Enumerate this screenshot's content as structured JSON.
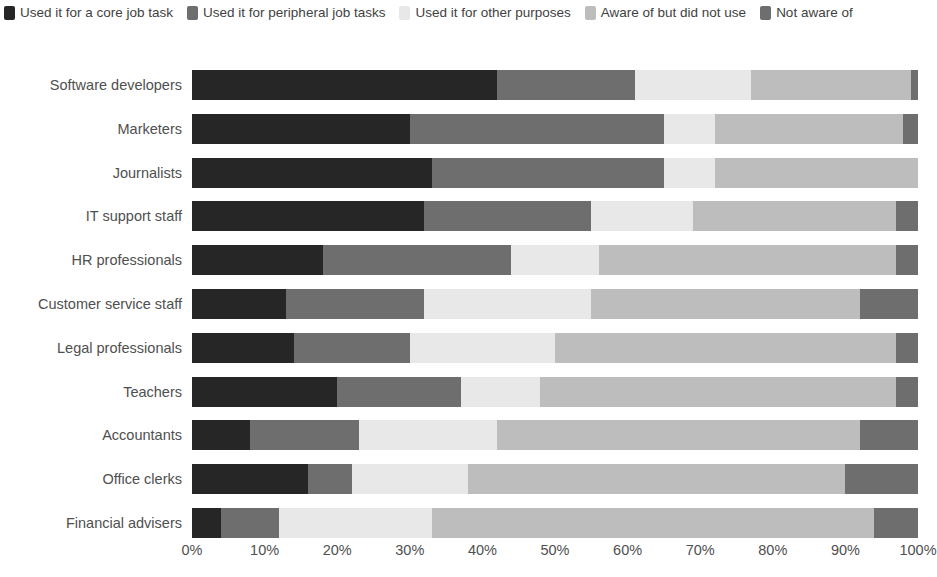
{
  "legend": {
    "items": [
      {
        "label": "Used it for a core job task",
        "color": "#262626",
        "swatch_icon": "legend-swatch-icon"
      },
      {
        "label": "Used it for peripheral job tasks",
        "color": "#6e6e6e",
        "swatch_icon": "legend-swatch-icon"
      },
      {
        "label": "Used it for other purposes",
        "color": "#e8e8e8",
        "swatch_icon": "legend-swatch-icon"
      },
      {
        "label": "Aware of but did not use",
        "color": "#bdbdbd",
        "swatch_icon": "legend-swatch-icon"
      },
      {
        "label": "Not aware of",
        "color": "#6e6e6e",
        "swatch_icon": "legend-swatch-icon"
      }
    ]
  },
  "chart_data": {
    "type": "bar",
    "orientation": "horizontal",
    "stacked": true,
    "stack_total": 100,
    "title": "",
    "subtitle": "",
    "xlabel": "",
    "ylabel": "",
    "xlim": [
      0,
      100
    ],
    "grid": false,
    "legend_position": "top-left",
    "xticks": [
      "0%",
      "10%",
      "20%",
      "30%",
      "40%",
      "50%",
      "60%",
      "70%",
      "80%",
      "90%",
      "100%"
    ],
    "xtick_values": [
      0,
      10,
      20,
      30,
      40,
      50,
      60,
      70,
      80,
      90,
      100
    ],
    "categories": [
      "Software developers",
      "Marketers",
      "Journalists",
      "IT support staff",
      "HR professionals",
      "Customer service staff",
      "Legal professionals",
      "Teachers",
      "Accountants",
      "Office clerks",
      "Financial advisers"
    ],
    "series": [
      {
        "name": "Used it for a core job task",
        "color": "#262626",
        "values": [
          42,
          30,
          33,
          32,
          18,
          13,
          14,
          20,
          8,
          16,
          4
        ]
      },
      {
        "name": "Used it for peripheral job tasks",
        "color": "#6e6e6e",
        "values": [
          19,
          35,
          32,
          23,
          26,
          19,
          16,
          17,
          15,
          6,
          8
        ]
      },
      {
        "name": "Used it for other purposes",
        "color": "#e8e8e8",
        "values": [
          16,
          7,
          7,
          14,
          12,
          23,
          20,
          11,
          19,
          16,
          21
        ]
      },
      {
        "name": "Aware of but did not use",
        "color": "#bdbdbd",
        "values": [
          22,
          26,
          28,
          28,
          41,
          37,
          47,
          49,
          50,
          52,
          61
        ]
      },
      {
        "name": "Not aware of",
        "color": "#6e6e6e",
        "values": [
          1,
          2,
          0,
          3,
          3,
          8,
          3,
          3,
          8,
          10,
          6
        ]
      }
    ]
  }
}
